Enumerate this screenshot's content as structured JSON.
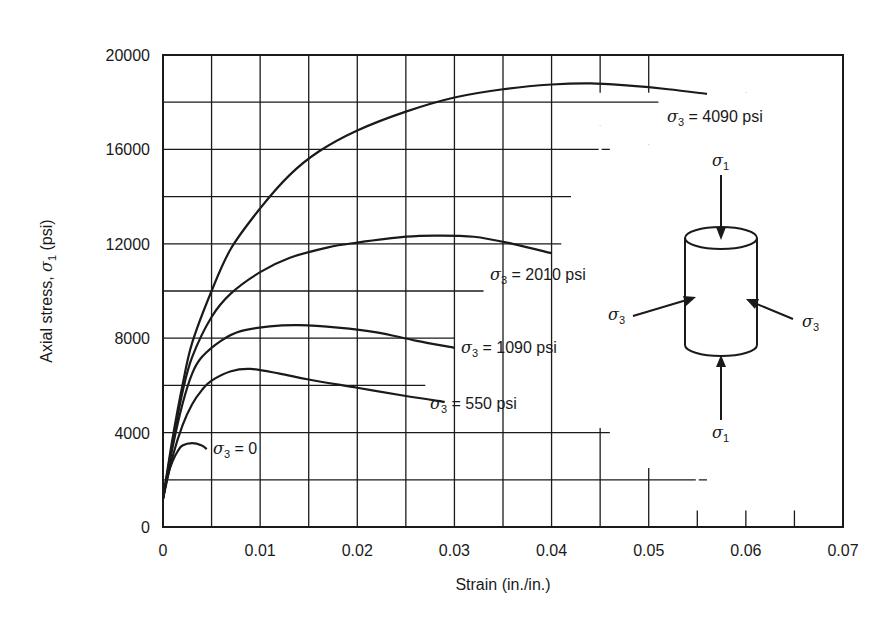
{
  "chart_data": {
    "type": "line",
    "title": "",
    "xlabel": "Strain (in./in.)",
    "ylabel": "Axial stress, σ1 (psi)",
    "xlim": [
      0,
      0.07
    ],
    "ylim": [
      0,
      20000
    ],
    "x_ticks": [
      "0",
      "0.01",
      "0.02",
      "0.03",
      "0.04",
      "0.05",
      "0.06",
      "0.07"
    ],
    "y_ticks": [
      "0",
      "4000",
      "8000",
      "12000",
      "16000",
      "20000"
    ],
    "grid": true,
    "legend": "inline labels at curve ends",
    "series": [
      {
        "name": "σ3 = 0",
        "label_text": "= 0",
        "points": [
          [
            0,
            1200
          ],
          [
            0.0005,
            2200
          ],
          [
            0.001,
            2800
          ],
          [
            0.0015,
            3200
          ],
          [
            0.002,
            3450
          ],
          [
            0.003,
            3550
          ],
          [
            0.004,
            3450
          ],
          [
            0.0045,
            3300
          ]
        ]
      },
      {
        "name": "σ3 = 550 psi",
        "label_text": "= 550  psi",
        "points": [
          [
            0,
            1200
          ],
          [
            0.001,
            3000
          ],
          [
            0.002,
            4300
          ],
          [
            0.003,
            5200
          ],
          [
            0.004,
            5800
          ],
          [
            0.005,
            6200
          ],
          [
            0.007,
            6600
          ],
          [
            0.009,
            6700
          ],
          [
            0.012,
            6500
          ],
          [
            0.015,
            6250
          ],
          [
            0.02,
            5900
          ],
          [
            0.025,
            5550
          ],
          [
            0.029,
            5300
          ]
        ]
      },
      {
        "name": "σ3 = 1090 psi",
        "label_text": "= 1090 psi",
        "points": [
          [
            0,
            1200
          ],
          [
            0.001,
            3400
          ],
          [
            0.002,
            5200
          ],
          [
            0.003,
            6500
          ],
          [
            0.004,
            7200
          ],
          [
            0.006,
            7900
          ],
          [
            0.008,
            8300
          ],
          [
            0.011,
            8500
          ],
          [
            0.014,
            8550
          ],
          [
            0.018,
            8450
          ],
          [
            0.022,
            8250
          ],
          [
            0.026,
            7900
          ],
          [
            0.03,
            7600
          ]
        ]
      },
      {
        "name": "σ3 = 2010 psi",
        "label_text": "= 2010 psi",
        "points": [
          [
            0,
            1200
          ],
          [
            0.001,
            3600
          ],
          [
            0.002,
            5700
          ],
          [
            0.003,
            7200
          ],
          [
            0.005,
            8900
          ],
          [
            0.007,
            9900
          ],
          [
            0.01,
            10800
          ],
          [
            0.013,
            11400
          ],
          [
            0.017,
            11850
          ],
          [
            0.02,
            12050
          ],
          [
            0.025,
            12300
          ],
          [
            0.028,
            12350
          ],
          [
            0.032,
            12300
          ],
          [
            0.036,
            12000
          ],
          [
            0.04,
            11600
          ]
        ]
      },
      {
        "name": "σ3 = 4090 psi",
        "label_text": "= 4090 psi",
        "points": [
          [
            0,
            1200
          ],
          [
            0.001,
            3800
          ],
          [
            0.002,
            6000
          ],
          [
            0.003,
            7800
          ],
          [
            0.005,
            10000
          ],
          [
            0.007,
            11800
          ],
          [
            0.01,
            13500
          ],
          [
            0.013,
            14900
          ],
          [
            0.016,
            15900
          ],
          [
            0.02,
            16800
          ],
          [
            0.025,
            17600
          ],
          [
            0.03,
            18200
          ],
          [
            0.035,
            18550
          ],
          [
            0.04,
            18750
          ],
          [
            0.044,
            18800
          ],
          [
            0.048,
            18700
          ],
          [
            0.052,
            18550
          ],
          [
            0.056,
            18350
          ]
        ]
      }
    ],
    "annotations": {
      "diagram": "cylindrical specimen with axial stress σ1 arrows (top and bottom) and confining stress σ3 arrows (left and right)",
      "labels": [
        "σ1",
        "σ1",
        "σ3",
        "σ3"
      ]
    }
  },
  "labels": {
    "sigma": "σ",
    "sub1": "1",
    "sub3": "3",
    "ylabel_prefix": "Axial stress, ",
    "ylabel_suffix": " (psi)"
  }
}
